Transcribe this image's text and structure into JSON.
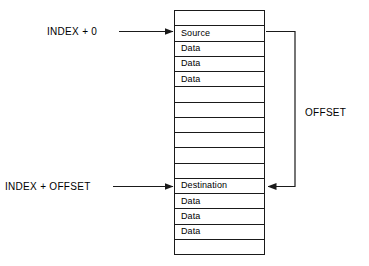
{
  "diagram": {
    "stroke_color": "#1a1a1a",
    "background_color": "#ffffff",
    "memory_table": {
      "name": "memory-block",
      "rows": [
        {
          "label": "",
          "kind": "empty"
        },
        {
          "label": "Source",
          "kind": "marker"
        },
        {
          "label": "Data",
          "kind": "data"
        },
        {
          "label": "Data",
          "kind": "data"
        },
        {
          "label": "Data",
          "kind": "data"
        },
        {
          "label": "",
          "kind": "empty"
        },
        {
          "label": "",
          "kind": "empty"
        },
        {
          "label": "",
          "kind": "empty"
        },
        {
          "label": "",
          "kind": "empty"
        },
        {
          "label": "",
          "kind": "empty"
        },
        {
          "label": "",
          "kind": "empty"
        },
        {
          "label": "Destination",
          "kind": "marker"
        },
        {
          "label": "Data",
          "kind": "data"
        },
        {
          "label": "Data",
          "kind": "data"
        },
        {
          "label": "Data",
          "kind": "data"
        },
        {
          "label": "",
          "kind": "empty"
        }
      ]
    },
    "labels": {
      "index_zero": "INDEX + 0",
      "index_offset": "INDEX + OFFSET",
      "offset": "OFFSET"
    },
    "connectors": [
      {
        "name": "index-zero-arrow",
        "from_label": "INDEX + 0",
        "to_row": "Source",
        "direction": "right"
      },
      {
        "name": "index-offset-arrow",
        "from_label": "INDEX + OFFSET",
        "to_row": "Destination",
        "direction": "right"
      },
      {
        "name": "offset-bracket",
        "from_row": "Source",
        "to_row": "Destination",
        "direction": "left",
        "label": "OFFSET"
      }
    ]
  }
}
